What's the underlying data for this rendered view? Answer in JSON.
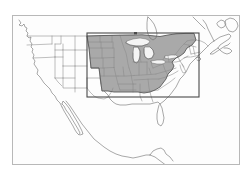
{
  "figure": {
    "type": "reference-map",
    "background_color": "#ffffff",
    "frame": {
      "label": "map-frame",
      "x": 12,
      "y": 15,
      "width": 228,
      "height": 150,
      "stroke_color": "#b8b8b8",
      "fill_color": "#fdfdfd",
      "stroke_width": 1
    },
    "coastline": {
      "label": "north-america-coastline",
      "stroke_color": "#6e6e6e",
      "stroke_width": 0.6,
      "fill_color": "none"
    },
    "state_borders": {
      "label": "us-state-boundaries",
      "stroke_color": "#8a8a8a",
      "stroke_width": 0.55
    },
    "highlight_region": {
      "label": "shaded-study-region",
      "fill_color": "#a9a9a9",
      "stroke_color": "#5a5a5a",
      "stroke_width": 0.9,
      "opacity": 1,
      "description": "Contiguous block of US states spanning the Upper Midwest, Great Plains, Great Lakes, Ohio Valley, Mid-Atlantic and Northeast"
    },
    "bounding_box": {
      "label": "extent-rectangle",
      "x": 87,
      "y": 33,
      "width": 112,
      "height": 64,
      "stroke_color": "#4a4a4a",
      "stroke_width": 1.1,
      "fill": "none"
    },
    "lakes": {
      "label": "great-lakes",
      "fill_color": "#f4f4f4",
      "stroke_color": "#6e6e6e",
      "stroke_width": 0.5
    }
  },
  "legend": {
    "visible": false,
    "entries": []
  },
  "labels": {
    "visible": false,
    "items": []
  },
  "axes": {
    "visible": false,
    "x_ticks": [],
    "y_ticks": []
  }
}
